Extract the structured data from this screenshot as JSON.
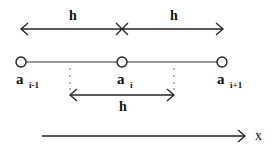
{
  "diagram": {
    "top_arrows": {
      "left_label": "h",
      "right_label": "h",
      "center_marker": "x-mark"
    },
    "nodes": [
      {
        "id": "a_i-1",
        "base": "a",
        "subscript": "i-1"
      },
      {
        "id": "a_i",
        "base": "a",
        "subscript": "i"
      },
      {
        "id": "a_i+1",
        "base": "a",
        "subscript": "i+1"
      }
    ],
    "interval_arrow": {
      "label": "h"
    },
    "axis": {
      "label": "x"
    },
    "colors": {
      "stroke": "#222222",
      "background": "#ffffff"
    }
  }
}
